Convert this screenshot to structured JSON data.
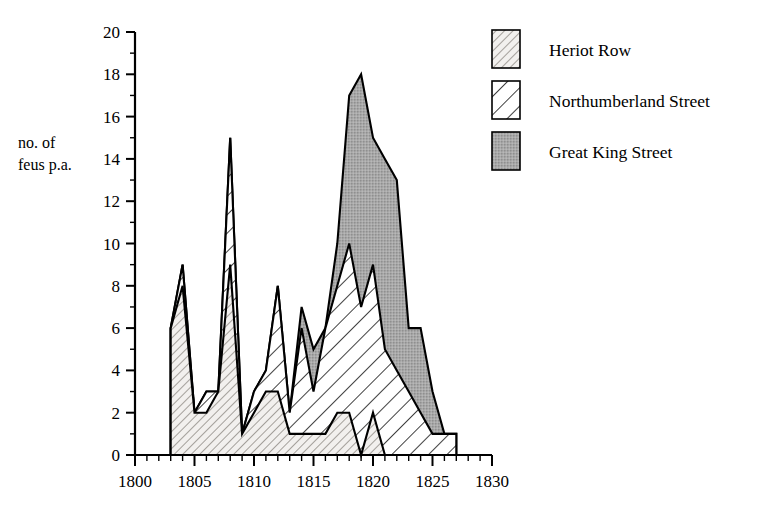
{
  "chart_data": {
    "type": "area",
    "title": "",
    "subtitle": "",
    "xlabel": "",
    "ylabel": "no. of feus p.a.",
    "ylabel_line1": "no. of",
    "ylabel_line2": "feus p.a.",
    "stacked": true,
    "grid": false,
    "legend_position": "top-right",
    "xlim": [
      1800,
      1830
    ],
    "ylim": [
      0,
      20
    ],
    "x_major_ticks": [
      1800,
      1805,
      1810,
      1815,
      1820,
      1825,
      1830
    ],
    "x_major_tick_labels": [
      "1800",
      "1805",
      "1810",
      "1815",
      "1820",
      "1825",
      "1830"
    ],
    "x_minor_tick_step": 1,
    "y_major_ticks": [
      0,
      2,
      4,
      6,
      8,
      10,
      12,
      14,
      16,
      18,
      20
    ],
    "y_major_tick_labels": [
      "0",
      "2",
      "4",
      "6",
      "8",
      "10",
      "12",
      "14",
      "16",
      "18",
      "20"
    ],
    "y_minor_tick_step": 1,
    "x": [
      1803,
      1804,
      1805,
      1806,
      1807,
      1808,
      1809,
      1810,
      1811,
      1812,
      1813,
      1814,
      1815,
      1816,
      1817,
      1818,
      1819,
      1820,
      1821,
      1822,
      1823,
      1824,
      1825,
      1826,
      1827
    ],
    "series": [
      {
        "name": "Heriot Row",
        "fill": "fine-hatch",
        "values": [
          6,
          8,
          2,
          2,
          3,
          9,
          1,
          2,
          3,
          3,
          1,
          1,
          1,
          1,
          2,
          2,
          0,
          2,
          0,
          0,
          0,
          0,
          0,
          0,
          0
        ]
      },
      {
        "name": "Northumberland Street",
        "fill": "wide-hatch",
        "values": [
          0,
          1,
          0,
          1,
          0,
          6,
          0,
          1,
          1,
          5,
          1,
          5,
          2,
          5,
          6,
          8,
          7,
          0,
          0,
          0,
          0,
          0,
          0,
          0,
          0
        ],
        "cumulative_values": [
          6,
          9,
          2,
          3,
          3,
          15,
          1,
          3,
          4,
          8,
          2,
          6,
          3,
          6,
          8,
          10,
          7,
          9,
          5,
          4,
          3,
          2,
          1,
          1,
          1
        ]
      },
      {
        "name": "Great King Street",
        "fill": "gray-stipple",
        "values": [
          0,
          0,
          0,
          0,
          0,
          0,
          0,
          0,
          0,
          0,
          0,
          1,
          2,
          0,
          2,
          7,
          11,
          9,
          10,
          9,
          3,
          4,
          2,
          0,
          0
        ],
        "cumulative_values": [
          6,
          9,
          2,
          3,
          3,
          15,
          1,
          3,
          4,
          8,
          2,
          7,
          5,
          6,
          10,
          17,
          18,
          15,
          14,
          13,
          6,
          6,
          3,
          1,
          1
        ]
      }
    ]
  },
  "legend": {
    "items": [
      {
        "label": "Heriot Row",
        "fill": "fine-hatch"
      },
      {
        "label": "Northumberland Street",
        "fill": "wide-hatch"
      },
      {
        "label": "Great King Street",
        "fill": "gray-stipple"
      }
    ]
  },
  "colors": {
    "axis": "#000000",
    "outline": "#000000",
    "fine_hatch_bg": "#f2f0ee",
    "fine_hatch_line": "#8a8580",
    "wide_hatch_bg": "#ffffff",
    "wide_hatch_line": "#000000",
    "gray_stipple_bg": "#a9a9a9",
    "gray_stipple_dot": "#7d7d7d",
    "background": "#ffffff"
  }
}
